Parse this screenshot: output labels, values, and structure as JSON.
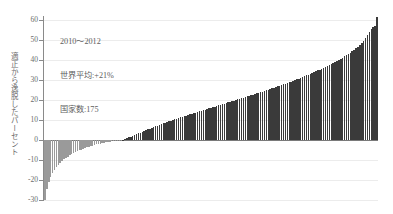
{
  "annotation": {
    "period": "2010〜2012",
    "world_average": "世界平均:+21%",
    "country_count": "国家数:175"
  },
  "axis": {
    "y_title": "適正から逸脱したパーセント",
    "y_ticks": [
      60,
      50,
      40,
      30,
      20,
      10,
      0,
      -10,
      -20,
      -30
    ]
  },
  "colors": {
    "bar_positive": "#3a3a3a",
    "bar_negative": "#9a9a9a",
    "gridline": "#ececec",
    "zero_line": "#7a7a7a",
    "axis": "#8a8a8a",
    "text": "#5e5e5e"
  },
  "chart_data": {
    "type": "bar",
    "title": "",
    "subtitle": "",
    "xlabel": "",
    "ylabel": "適正から逸脱したパーセント",
    "ylim": [
      -30,
      62
    ],
    "xlim": [
      0,
      175
    ],
    "grid": true,
    "legend": null,
    "annotations": [
      "2010〜2012",
      "世界平均:+21%",
      "国家数:175"
    ],
    "categories": [
      "1",
      "2",
      "3",
      "4",
      "5",
      "6",
      "7",
      "8",
      "9",
      "10",
      "11",
      "12",
      "13",
      "14",
      "15",
      "16",
      "17",
      "18",
      "19",
      "20",
      "21",
      "22",
      "23",
      "24",
      "25",
      "26",
      "27",
      "28",
      "29",
      "30",
      "31",
      "32",
      "33",
      "34",
      "35",
      "36",
      "37",
      "38",
      "39",
      "40",
      "41",
      "42",
      "43",
      "44",
      "45",
      "46",
      "47",
      "48",
      "49",
      "50",
      "51",
      "52",
      "53",
      "54",
      "55",
      "56",
      "57",
      "58",
      "59",
      "60",
      "61",
      "62",
      "63",
      "64",
      "65",
      "66",
      "67",
      "68",
      "69",
      "70",
      "71",
      "72",
      "73",
      "74",
      "75",
      "76",
      "77",
      "78",
      "79",
      "80",
      "81",
      "82",
      "83",
      "84",
      "85",
      "86",
      "87",
      "88",
      "89",
      "90",
      "91",
      "92",
      "93",
      "94",
      "95",
      "96",
      "97",
      "98",
      "99",
      "100",
      "101",
      "102",
      "103",
      "104",
      "105",
      "106",
      "107",
      "108",
      "109",
      "110",
      "111",
      "112",
      "113",
      "114",
      "115",
      "116",
      "117",
      "118",
      "119",
      "120",
      "121",
      "122",
      "123",
      "124",
      "125",
      "126",
      "127",
      "128",
      "129",
      "130",
      "131",
      "132",
      "133",
      "134",
      "135",
      "136",
      "137",
      "138",
      "139",
      "140",
      "141",
      "142",
      "143",
      "144",
      "145",
      "146",
      "147",
      "148",
      "149",
      "150",
      "151",
      "152",
      "153",
      "154",
      "155",
      "156",
      "157",
      "158",
      "159",
      "160",
      "161",
      "162",
      "163",
      "164",
      "165",
      "166",
      "167",
      "168",
      "169",
      "170",
      "171",
      "172",
      "173",
      "174",
      "175"
    ],
    "values": [
      -30.0,
      -24.5,
      -21.0,
      -18.5,
      -16.5,
      -15.0,
      -13.6,
      -12.4,
      -11.4,
      -10.5,
      -9.7,
      -9.0,
      -8.3,
      -7.7,
      -7.1,
      -6.6,
      -6.1,
      -5.6,
      -5.2,
      -4.8,
      -4.4,
      -4.0,
      -3.7,
      -3.4,
      -3.1,
      -2.8,
      -2.5,
      -2.2,
      -2.0,
      -1.8,
      -1.6,
      -1.4,
      -1.2,
      -1.0,
      -0.8,
      -0.7,
      -0.5,
      -0.4,
      -0.3,
      -0.2,
      -0.1,
      0.2,
      0.5,
      0.9,
      1.3,
      1.7,
      2.1,
      2.5,
      2.9,
      3.3,
      3.7,
      4.1,
      4.5,
      4.9,
      5.3,
      5.7,
      6.1,
      6.5,
      6.9,
      7.2,
      7.6,
      8.0,
      8.3,
      8.7,
      9.0,
      9.4,
      9.7,
      10.0,
      10.4,
      10.7,
      11.0,
      11.3,
      11.6,
      11.9,
      12.2,
      12.5,
      12.8,
      13.1,
      13.4,
      13.7,
      14.0,
      14.3,
      14.6,
      14.9,
      15.2,
      15.5,
      15.8,
      16.1,
      16.4,
      16.7,
      17.0,
      17.3,
      17.6,
      17.9,
      18.2,
      18.5,
      18.8,
      19.1,
      19.4,
      19.7,
      20.0,
      20.3,
      20.6,
      20.9,
      21.2,
      21.5,
      21.8,
      22.1,
      22.4,
      22.7,
      23.0,
      23.3,
      23.6,
      23.9,
      24.2,
      24.5,
      24.8,
      25.1,
      25.4,
      25.8,
      26.1,
      26.4,
      26.8,
      27.1,
      27.5,
      27.8,
      28.2,
      28.5,
      28.9,
      29.2,
      29.6,
      30.0,
      30.3,
      30.7,
      31.1,
      31.5,
      31.9,
      32.3,
      32.7,
      33.1,
      33.5,
      33.9,
      34.3,
      34.8,
      35.2,
      35.6,
      36.1,
      36.5,
      37.0,
      37.5,
      38.0,
      38.5,
      39.0,
      39.5,
      40.1,
      40.6,
      41.2,
      41.8,
      42.4,
      43.0,
      43.7,
      44.4,
      45.1,
      45.9,
      46.7,
      47.6,
      48.6,
      49.7,
      51.0,
      52.5,
      54.2,
      55.5,
      56.3,
      57.0,
      61.5
    ]
  }
}
